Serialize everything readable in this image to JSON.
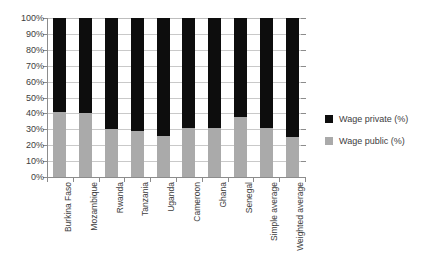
{
  "chart_data": {
    "type": "bar",
    "subtype": "stacked-100-percent",
    "title": "",
    "xlabel": "",
    "ylabel": "",
    "ylim": [
      0,
      100
    ],
    "ytick_labels": [
      "100%",
      "90%",
      "80%",
      "70%",
      "60%",
      "50%",
      "40%",
      "30%",
      "20%",
      "10%",
      "0%"
    ],
    "ytick_values": [
      100,
      90,
      80,
      70,
      60,
      50,
      40,
      30,
      20,
      10,
      0
    ],
    "grid": true,
    "grid_axis": "y",
    "legend_position": "right",
    "categories": [
      "Burkina Faso",
      "Mozambique",
      "Rwanda",
      "Tanzania",
      "Uganda",
      "Cameroon",
      "Ghana",
      "Senegal",
      "Simple average",
      "Weighted average"
    ],
    "series": [
      {
        "name": "Wage private (%)",
        "color": "#0d0d0d",
        "values": [
          59,
          60,
          70,
          71,
          74,
          69,
          69,
          62,
          69,
          75
        ]
      },
      {
        "name": "Wage public (%)",
        "color": "#aaaaaa",
        "values": [
          41,
          40,
          30,
          29,
          26,
          31,
          31,
          38,
          31,
          25
        ]
      }
    ]
  },
  "legend": {
    "items": [
      {
        "label": "Wage private (%)",
        "color": "#0d0d0d"
      },
      {
        "label": "Wage public (%)",
        "color": "#aaaaaa"
      }
    ]
  },
  "colors": {
    "private": "#0d0d0d",
    "public": "#aaaaaa",
    "axis": "#8c8c8c",
    "grid": "#c9c9c9",
    "text": "#3d3d3d",
    "background": "#ffffff"
  }
}
